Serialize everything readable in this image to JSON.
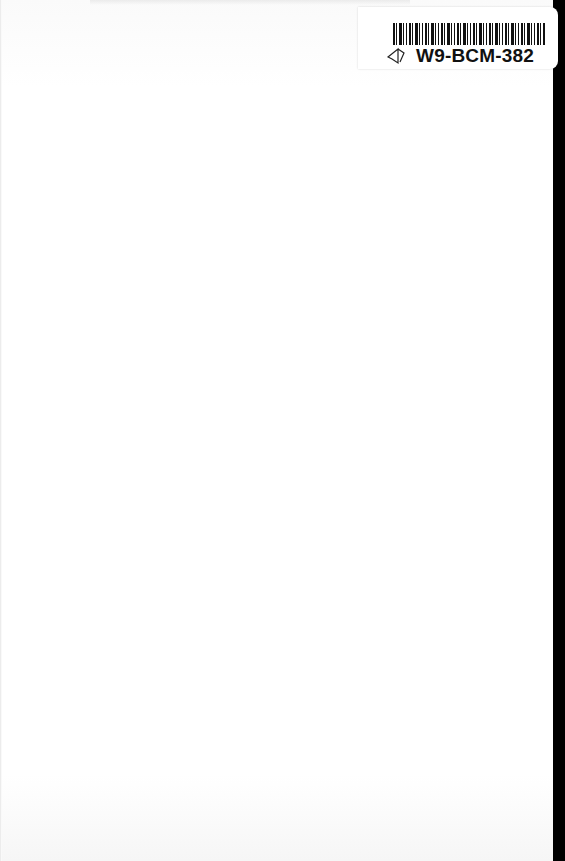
{
  "page": {
    "type": "blank scanned book page",
    "background_color": "#ffffff"
  },
  "barcode_label": {
    "code": "W9-BCM-382",
    "icon": "book-logo-icon"
  }
}
